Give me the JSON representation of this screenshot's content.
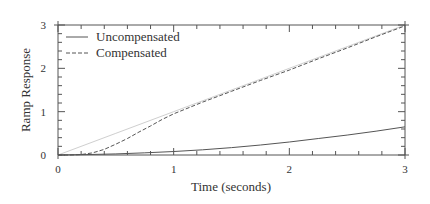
{
  "chart_data": {
    "type": "line",
    "title": "",
    "xlabel": "Time (seconds)",
    "ylabel": "Ramp Response",
    "xlim": [
      0,
      3
    ],
    "ylim": [
      0,
      3
    ],
    "x_ticks": [
      0,
      1,
      2,
      3
    ],
    "y_ticks": [
      0,
      1,
      2,
      3
    ],
    "x_minor_step": 0.2,
    "y_minor_step": 0.2,
    "grid": false,
    "legend_position": "upper left",
    "series": [
      {
        "name": "Reference ramp",
        "in_legend": false,
        "style": "solid",
        "color": "#cfcfcf",
        "x": [
          0,
          0.5,
          1.0,
          1.5,
          2.0,
          2.5,
          3.0
        ],
        "values": [
          0,
          0.5,
          1.0,
          1.5,
          2.0,
          2.5,
          3.0
        ]
      },
      {
        "name": "Uncompensated",
        "in_legend": true,
        "style": "solid",
        "color": "#555555",
        "x": [
          0,
          0.25,
          0.5,
          0.75,
          1.0,
          1.25,
          1.5,
          1.75,
          2.0,
          2.25,
          2.5,
          2.75,
          3.0
        ],
        "values": [
          0,
          0.01,
          0.025,
          0.05,
          0.08,
          0.12,
          0.17,
          0.23,
          0.3,
          0.38,
          0.46,
          0.55,
          0.65
        ]
      },
      {
        "name": "Compensated",
        "in_legend": true,
        "style": "dashed",
        "color": "#555555",
        "x": [
          0,
          0.1,
          0.2,
          0.3,
          0.4,
          0.5,
          0.6,
          0.7,
          0.8,
          0.9,
          1.0,
          1.25,
          1.5,
          1.75,
          2.0,
          2.25,
          2.5,
          2.75,
          3.0
        ],
        "values": [
          0,
          0,
          0.01,
          0.05,
          0.13,
          0.25,
          0.38,
          0.53,
          0.67,
          0.82,
          0.95,
          1.22,
          1.47,
          1.72,
          1.96,
          2.22,
          2.47,
          2.73,
          2.98
        ]
      }
    ]
  },
  "legend": {
    "items": [
      {
        "label": "Uncompensated",
        "style": "solid"
      },
      {
        "label": "Compensated",
        "style": "dashed"
      }
    ]
  },
  "axes": {
    "x_tick_labels": [
      "0",
      "1",
      "2",
      "3"
    ],
    "y_tick_labels": [
      "0",
      "1",
      "2",
      "3"
    ],
    "xlabel": "Time (seconds)",
    "ylabel": "Ramp Response"
  },
  "colors": {
    "axis": "#555555",
    "reference": "#cfcfcf",
    "series": "#555555",
    "text": "#333333"
  }
}
